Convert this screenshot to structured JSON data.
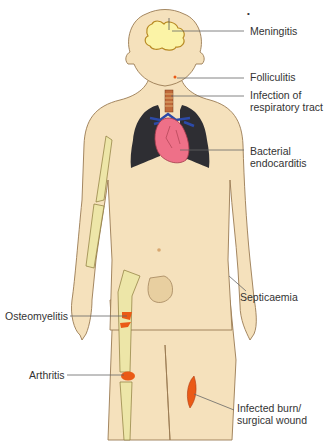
{
  "figure": {
    "marker": "•",
    "labels": {
      "meningitis": "Meningitis",
      "folliculitis": "Folliculitis",
      "respiratory": "Infection of\nrespiratory tract",
      "endocarditis": "Bacterial\nendocarditis",
      "septicaemia": "Septicaemia",
      "osteomyelitis": "Osteomyelitis",
      "arthritis": "Arthritis",
      "wound": "Infected burn/\nsurgical wound"
    },
    "colors": {
      "skin": "#f5e1bc",
      "skin_outline": "#9a7a52",
      "bone": "#ede6a8",
      "brain": "#fbf3a6",
      "lungs": "#2e2e33",
      "heart": "#ee7088",
      "vessels": "#2c4aa8",
      "infection": "#ea5a16",
      "leader_line": "#666666",
      "text": "#333333"
    }
  }
}
